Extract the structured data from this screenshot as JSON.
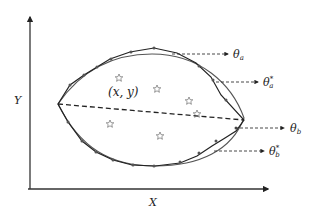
{
  "diagram": {
    "axes": {
      "x_label": "X",
      "y_label": "Y"
    },
    "point_label": "(x, y)",
    "annotations": [
      {
        "id": "theta_a",
        "base": "θ",
        "sub": "a",
        "sup": ""
      },
      {
        "id": "theta_a_star",
        "base": "θ",
        "sub": "a",
        "sup": "*"
      },
      {
        "id": "theta_b",
        "base": "θ",
        "sub": "b",
        "sup": ""
      },
      {
        "id": "theta_b_star",
        "base": "θ",
        "sub": "b",
        "sup": "*"
      }
    ],
    "sample_points_count": 6,
    "colors": {
      "line_dark": "#222222",
      "line_fit": "#555555",
      "background": "#ffffff"
    }
  }
}
